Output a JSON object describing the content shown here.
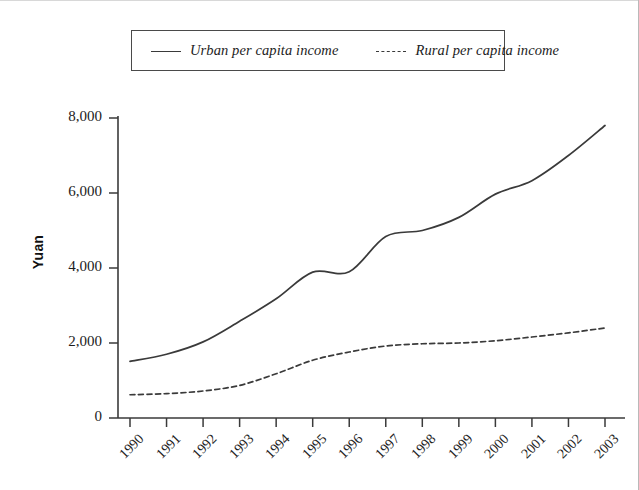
{
  "figure": {
    "background_color": "#ffffff",
    "line_color": "#3a3a3a"
  },
  "legend": {
    "position": "top-center",
    "entries": [
      {
        "label": "Urban per capita income",
        "style": "solid",
        "icon": "solid-line-swatch-icon"
      },
      {
        "label": "Rural per capita income",
        "style": "dashed",
        "icon": "dashed-line-swatch-icon"
      }
    ]
  },
  "axes": {
    "ylabel": "Yuan",
    "yticks": [
      "0",
      "2,000",
      "4,000",
      "6,000",
      "8,000"
    ],
    "xticks": [
      "1990",
      "1991",
      "1992",
      "1993",
      "1994",
      "1995",
      "1996",
      "1997",
      "1998",
      "1999",
      "2000",
      "2001",
      "2002",
      "2003"
    ]
  },
  "chart_data": {
    "type": "line",
    "title": "",
    "subtitle": "",
    "xlabel": "",
    "ylabel": "Yuan",
    "categories": [
      "1990",
      "1991",
      "1992",
      "1993",
      "1994",
      "1995",
      "1996",
      "1997",
      "1998",
      "1999",
      "2000",
      "2001",
      "2002",
      "2003"
    ],
    "x": [
      1990,
      1991,
      1992,
      1993,
      1994,
      1995,
      1996,
      1997,
      1998,
      1999,
      2000,
      2001,
      2002,
      2003
    ],
    "ylim": [
      0,
      8000
    ],
    "ytick_values": [
      0,
      2000,
      4000,
      6000,
      8000
    ],
    "grid": false,
    "legend_position": "top-center",
    "interpolation": "smooth",
    "series": [
      {
        "name": "Urban per capita income",
        "style": "solid",
        "color": "#3a3a3a",
        "values": [
          1510,
          1700,
          2030,
          2580,
          3180,
          3890,
          3900,
          4840,
          5000,
          5350,
          5970,
          6330,
          7000,
          7800
        ]
      },
      {
        "name": "Rural per capita income",
        "style": "dashed",
        "color": "#3a3a3a",
        "values": [
          620,
          650,
          720,
          870,
          1180,
          1540,
          1760,
          1920,
          1980,
          2000,
          2060,
          2160,
          2270,
          2400
        ]
      }
    ]
  }
}
